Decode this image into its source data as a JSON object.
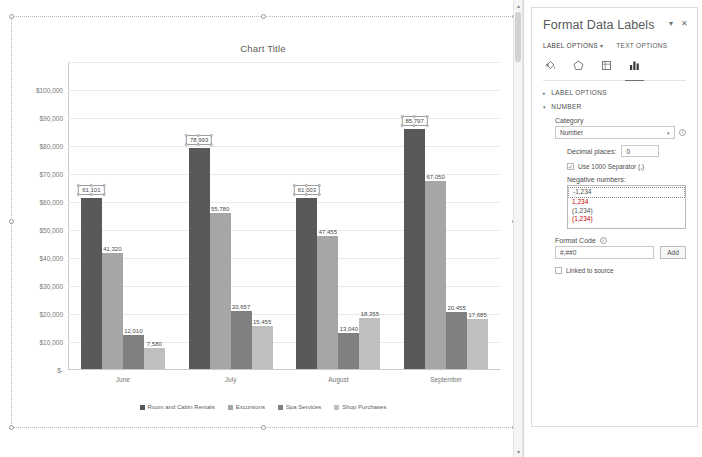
{
  "chart_object": {
    "title": "Chart Title",
    "buttons": [
      {
        "name": "chart-elements-button",
        "glyph": "+"
      },
      {
        "name": "chart-styles-button",
        "glyph": "✎"
      },
      {
        "name": "chart-filters-button",
        "glyph": "▼"
      }
    ]
  },
  "chart_data": {
    "type": "bar",
    "title": "Chart Title",
    "xlabel": "",
    "ylabel": "",
    "ylim": [
      0,
      110000
    ],
    "grid": true,
    "legend_position": "bottom",
    "categories": [
      "June",
      "July",
      "August",
      "September"
    ],
    "ytick_labels": [
      "$110,000",
      "$100,000",
      "$90,000",
      "$80,000",
      "$70,000",
      "$60,000",
      "$50,000",
      "$40,000",
      "$30,000",
      "$20,000",
      "$10,000",
      "$-"
    ],
    "ytick_values": [
      110000,
      100000,
      90000,
      80000,
      70000,
      60000,
      50000,
      40000,
      30000,
      20000,
      10000,
      0
    ],
    "series": [
      {
        "name": "Room and Cabin Rentals",
        "color": "#595959",
        "values": [
          61101,
          78993,
          61003,
          85797
        ],
        "labels": [
          "61,101",
          "78,993",
          "61,003",
          "85,797"
        ]
      },
      {
        "name": "Excursions",
        "color": "#a6a6a6",
        "values": [
          41320,
          55780,
          47455,
          67050
        ],
        "labels": [
          "41,320",
          "55,780",
          "47,455",
          "67,050"
        ]
      },
      {
        "name": "Spa Services",
        "color": "#808080",
        "values": [
          12010,
          20657,
          13040,
          20455
        ],
        "labels": [
          "12,010",
          "20,657",
          "13,040",
          "20,455"
        ]
      },
      {
        "name": "Shop Purchases",
        "color": "#bfbfbf",
        "values": [
          7580,
          15455,
          18355,
          17685
        ],
        "labels": [
          "7,580",
          "15,455",
          "18,355",
          "17,685"
        ]
      }
    ],
    "selected_series_index": 0
  },
  "pane": {
    "title": "Format Data Labels",
    "collapse_glyph": "▾",
    "close_glyph": "✕",
    "tabs": [
      {
        "label": "LABEL OPTIONS",
        "active": true,
        "has_caret": true
      },
      {
        "label": "TEXT OPTIONS",
        "active": false,
        "has_caret": false
      }
    ],
    "icons": [
      {
        "name": "fill-and-line-icon",
        "active": false
      },
      {
        "name": "effects-icon",
        "active": false
      },
      {
        "name": "size-and-properties-icon",
        "active": false
      },
      {
        "name": "label-options-icon",
        "active": true
      }
    ],
    "sections": {
      "label_options": {
        "label": "LABEL OPTIONS",
        "expanded": false,
        "tri": "▸"
      },
      "number": {
        "label": "NUMBER",
        "expanded": true,
        "tri": "▾"
      }
    },
    "category": {
      "label": "Category",
      "value": "Number",
      "arrow": "▾"
    },
    "decimal_places": {
      "label": "Decimal places:",
      "value": "0"
    },
    "thousands_separator": {
      "label": "Use 1000 Separator (,)",
      "checked": true,
      "check_glyph": "✓"
    },
    "negative_numbers": {
      "label": "Negative numbers:",
      "options": [
        {
          "text": "-1,234",
          "red": false,
          "selected": true
        },
        {
          "text": "1,234",
          "red": true,
          "selected": false
        },
        {
          "text": "(1,234)",
          "red": false,
          "selected": false
        },
        {
          "text": "(1,234)",
          "red": true,
          "selected": false
        }
      ]
    },
    "format_code": {
      "label": "Format Code",
      "value": "#,##0",
      "add_button": "Add",
      "info_glyph": "i"
    },
    "linked_to_source": {
      "label": "Linked to source",
      "checked": false
    }
  },
  "scrollbar": {
    "up_arrow": "▴",
    "down_arrow": "▾"
  }
}
